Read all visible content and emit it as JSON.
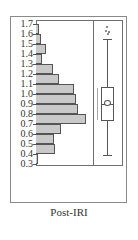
{
  "chart_data": {
    "type": "bar",
    "subtype": "histogram-with-boxplot",
    "orientation": "horizontal",
    "title": "",
    "caption": "Post-IRI",
    "xlabel": "",
    "ylabel": "",
    "ylim": [
      0.3,
      1.7
    ],
    "y_ticks": [
      "1.7",
      "1.6",
      "1.5",
      "1.4",
      "1.3",
      "1.2",
      "1.1",
      "1.0",
      "0.9",
      "0.8",
      "0.7",
      "0.6",
      "0.5",
      "0.4",
      "0.3"
    ],
    "bins": [
      {
        "range": "1.6-1.7",
        "value": 3
      },
      {
        "range": "1.5-1.6",
        "value": 5
      },
      {
        "range": "1.4-1.5",
        "value": 10
      },
      {
        "range": "1.3-1.4",
        "value": 6
      },
      {
        "range": "1.2-1.3",
        "value": 17
      },
      {
        "range": "1.1-1.2",
        "value": 23
      },
      {
        "range": "1.0-1.1",
        "value": 38
      },
      {
        "range": "0.9-1.0",
        "value": 40
      },
      {
        "range": "0.8-0.9",
        "value": 42
      },
      {
        "range": "0.7-0.8",
        "value": 50
      },
      {
        "range": "0.6-0.7",
        "value": 25
      },
      {
        "range": "0.5-0.6",
        "value": 18
      },
      {
        "range": "0.4-0.5",
        "value": 19
      },
      {
        "range": "0.3-0.4",
        "value": 2
      }
    ],
    "boxplot": {
      "whisker_high": 1.55,
      "q3": 1.07,
      "median": 0.89,
      "mean": 0.9,
      "q1": 0.73,
      "whisker_low": 0.39,
      "outliers": [
        1.62,
        1.64,
        1.66,
        1.68
      ],
      "bracket_range": [
        0.75,
        1.06
      ]
    },
    "grid": false,
    "legend": null
  },
  "caption": "Post-IRI"
}
